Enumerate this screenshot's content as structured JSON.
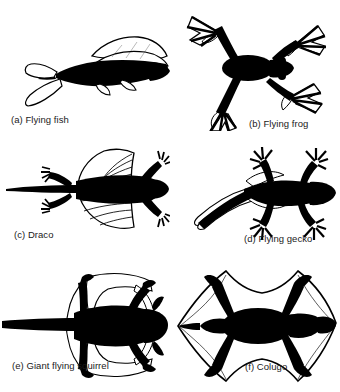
{
  "figure": {
    "kind": "scientific-illustration-plate",
    "background_color": "#ffffff",
    "silhouette_color": "#000000",
    "membrane_fill_color": "#ffffff",
    "membrane_outline_color": "#000000",
    "caption_color": "#1a1a1a",
    "rows": 3,
    "columns": 2,
    "panels": [
      {
        "key": "a",
        "letter": "(a)",
        "name": "Flying fish",
        "caption": "(a) Flying fish",
        "icon": "flying-fish-silhouette",
        "position": "top-left"
      },
      {
        "key": "b",
        "letter": "(b)",
        "name": "Flying frog",
        "caption": "(b) Flying frog",
        "icon": "flying-frog-silhouette",
        "position": "top-right"
      },
      {
        "key": "c",
        "letter": "(c)",
        "name": "Draco",
        "caption": "(c) Draco",
        "icon": "draco-lizard-silhouette",
        "position": "middle-left"
      },
      {
        "key": "d",
        "letter": "(d)",
        "name": "Flying gecko",
        "caption": "(d) Flying gecko",
        "icon": "flying-gecko-silhouette",
        "position": "middle-right"
      },
      {
        "key": "e",
        "letter": "(e)",
        "name": "Giant flying squirrel",
        "caption": "(e) Giant flying squirrel",
        "icon": "giant-flying-squirrel-silhouette",
        "position": "bottom-left"
      },
      {
        "key": "f",
        "letter": "(f)",
        "name": "Colugo",
        "caption": "(f) Colugo",
        "icon": "colugo-silhouette",
        "position": "bottom-right"
      }
    ]
  }
}
